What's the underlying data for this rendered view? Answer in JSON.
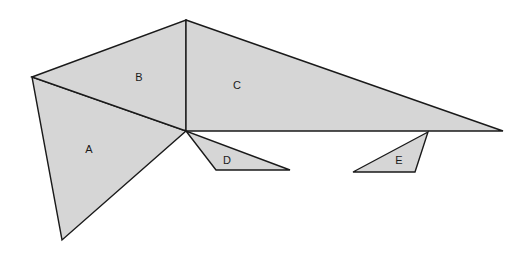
{
  "diagram": {
    "title": "",
    "fill_color": "#d6d6d6",
    "stroke_color": "#1a1a1a",
    "background": "#ffffff",
    "shapes": [
      {
        "id": "A",
        "label": "A",
        "points": "32,77 186,131 62,240",
        "label_pos": [
          89,
          150
        ]
      },
      {
        "id": "B",
        "label": "B",
        "points": "32,77 186,20 186,131",
        "label_pos": [
          139,
          78
        ]
      },
      {
        "id": "C",
        "label": "C",
        "points": "186,20 503,131 186,131",
        "label_pos": [
          237,
          86
        ]
      },
      {
        "id": "D",
        "label": "D",
        "points": "186,131 216,170 290,170",
        "label_pos": [
          227,
          161
        ]
      },
      {
        "id": "E",
        "label": "E",
        "points": "428,132 353,172 415,172",
        "label_pos": [
          399,
          161
        ]
      }
    ]
  }
}
